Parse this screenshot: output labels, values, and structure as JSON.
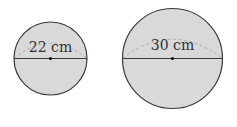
{
  "colors": {
    "fill": "#d9d9d9",
    "stroke": "#3a3a3a",
    "dashed_arc": "#a8a8a8",
    "center_dot": "#111111",
    "text": "#333333"
  },
  "circles": [
    {
      "label": "22 cm",
      "measurement": "diameter",
      "value": 22,
      "unit": "cm"
    },
    {
      "label": "30 cm",
      "measurement": "diameter",
      "value": 30,
      "unit": "cm"
    }
  ]
}
